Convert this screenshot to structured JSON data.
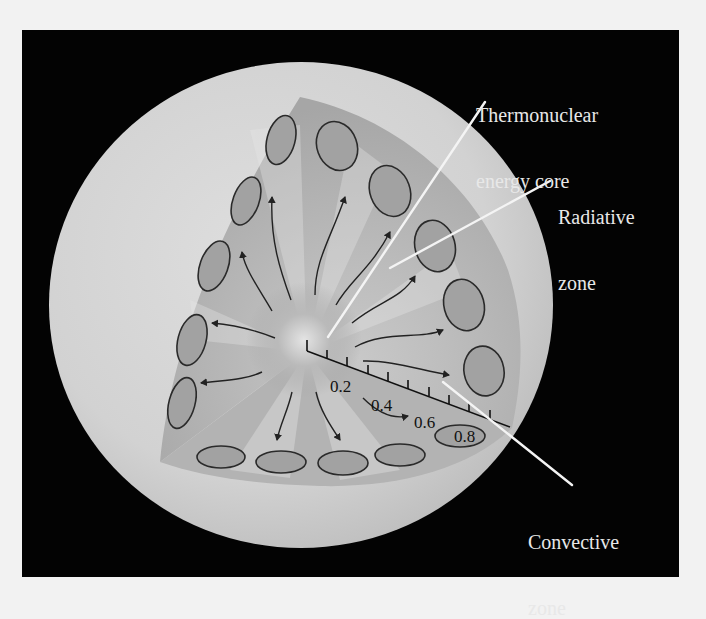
{
  "figure": {
    "background_color": "#f2f2f2",
    "panel_color": "#030303",
    "sphere_color": "#cfcfcf",
    "wedge_color": "#a9a9a9",
    "leader_line_color": "#f4f4f4"
  },
  "labels": [
    {
      "id": "core",
      "line1": "Thermonuclear",
      "line2": "energy core"
    },
    {
      "id": "radiative",
      "line1": "Radiative",
      "line2": "zone"
    },
    {
      "id": "convective",
      "line1": "Convective",
      "line2": "zone"
    }
  ],
  "scale_axis": {
    "ticks": [
      "0.2",
      "0.4",
      "0.6",
      "0.8"
    ],
    "tick_count": 10
  }
}
